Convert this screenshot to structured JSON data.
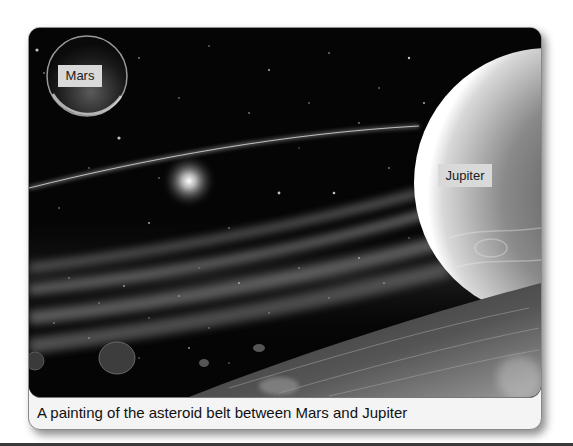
{
  "figure": {
    "labels": {
      "mars": "Mars",
      "jupiter": "Jupiter"
    },
    "caption": "A painting of the asteroid belt between Mars and Jupiter",
    "colors": {
      "space": "#050505",
      "label_bg": "#d9d9d9",
      "caption_bg": "#f4f4f4",
      "border": "#8a8a8a"
    }
  }
}
